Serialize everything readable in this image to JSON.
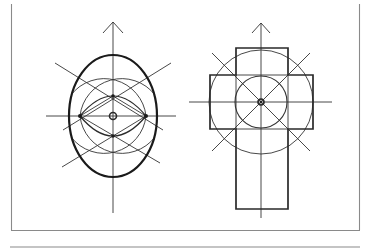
{
  "figure": {
    "colors": {
      "line": "#1a1a1a",
      "frame": "#8a8a8a",
      "background": "#ffffff"
    },
    "frame": {
      "left_x": 11,
      "right_x": 359,
      "bottom_y": 230,
      "separator_y": 247
    },
    "left_diagram": {
      "name": "oval-construction",
      "center": [
        113,
        116
      ],
      "axis_arrow_tip": [
        113,
        22
      ],
      "vertical_axis_end_y": 213,
      "horizontal_axis": [
        46,
        176
      ],
      "outer_oval": {
        "rx": 44,
        "ry": 61
      },
      "lens_points": [
        [
          80,
          116
        ],
        [
          146,
          116
        ]
      ],
      "inner_points": [
        [
          113,
          96
        ],
        [
          113,
          136
        ]
      ]
    },
    "right_diagram": {
      "name": "cross-plan-construction",
      "center": [
        261,
        102
      ],
      "axis_arrow_tip": [
        261,
        23
      ],
      "vertical_axis_end_y": 218,
      "horizontal_axis": [
        189,
        332
      ],
      "vertical_bar": {
        "x": 236,
        "y": 48,
        "w": 52,
        "h": 161
      },
      "horizontal_bar": {
        "x": 210,
        "y": 75,
        "w": 103,
        "h": 54
      },
      "outer_circle_r": 52,
      "inner_circle_r": 26
    }
  }
}
